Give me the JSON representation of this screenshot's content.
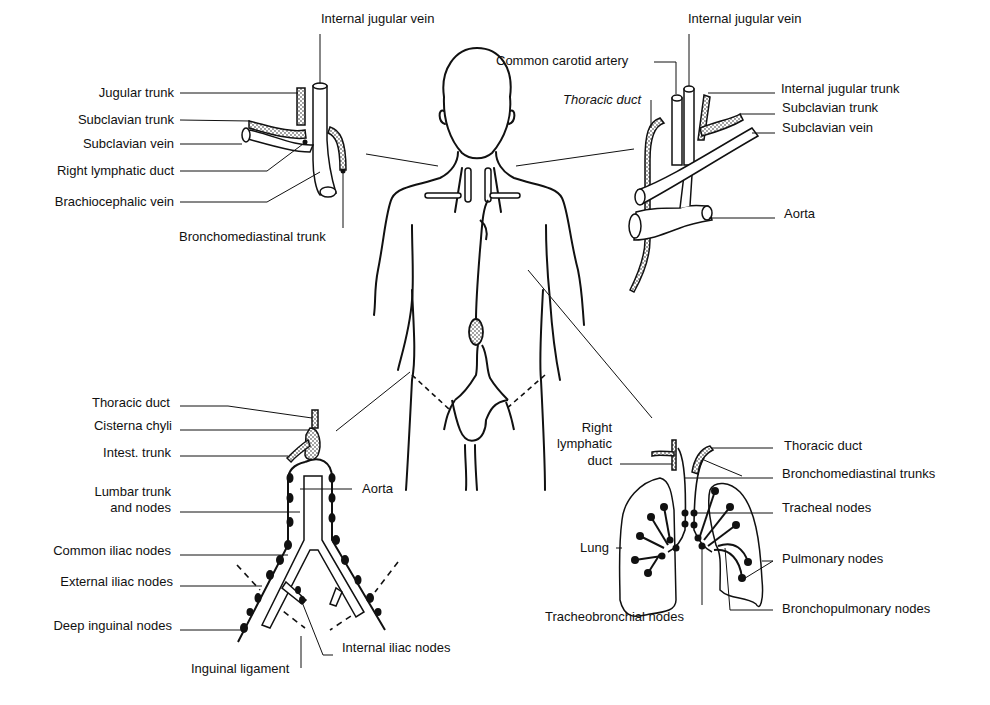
{
  "panels": {
    "neck_right": {
      "labels": {
        "internal_jugular_vein": "Internal jugular vein",
        "jugular_trunk": "Jugular trunk",
        "subclavian_trunk": "Subclavian trunk",
        "subclavian_vein": "Subclavian vein",
        "right_lymphatic_duct": "Right lymphatic duct",
        "brachiocephalic_vein": "Brachiocephalic vein",
        "bronchomediastinal_trunk": "Bronchomediastinal trunk"
      }
    },
    "neck_left": {
      "labels": {
        "common_carotid_artery": "Common carotid artery",
        "internal_jugular_vein": "Internal jugular vein",
        "thoracic_duct": "Thoracic duct",
        "internal_jugular_trunk": "Internal jugular trunk",
        "subclavian_trunk": "Subclavian trunk",
        "subclavian_vein": "Subclavian vein",
        "aorta": "Aorta"
      }
    },
    "abdomen_pelvis": {
      "labels": {
        "thoracic_duct": "Thoracic duct",
        "cisterna_chyli": "Cisterna chyli",
        "intest_trunk": "Intest. trunk",
        "lumbar_trunk_1": "Lumbar trunk",
        "lumbar_trunk_2": "and nodes",
        "aorta": "Aorta",
        "common_iliac_nodes": "Common iliac nodes",
        "external_iliac_nodes": "External iliac nodes",
        "deep_inguinal_nodes": "Deep inguinal nodes",
        "internal_iliac_nodes": "Internal iliac nodes",
        "inguinal_ligament": "Inguinal ligament"
      }
    },
    "thorax": {
      "labels": {
        "right_lymphatic_duct_1": "Right",
        "right_lymphatic_duct_2": "lymphatic",
        "right_lymphatic_duct_3": "duct",
        "thoracic_duct": "Thoracic duct",
        "bronchomediastinal_trunks": "Bronchomediastinal trunks",
        "tracheal_nodes": "Tracheal nodes",
        "lung": "Lung",
        "pulmonary_nodes": "Pulmonary nodes",
        "tracheobronchial_nodes": "Tracheobronchial nodes",
        "bronchopulmonary_nodes": "Bronchopulmonary nodes"
      }
    }
  },
  "colors": {
    "ink": "#111111",
    "stipple": "#9a9a9a",
    "background": "#ffffff"
  }
}
